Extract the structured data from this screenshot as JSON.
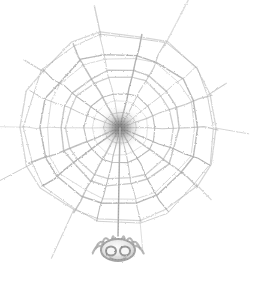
{
  "image": {
    "title": "Spider web with hanging spider",
    "subject": "orb-weaver spider web",
    "style": "faded grayscale halftone scan / clip-art illustration",
    "background_color": "#ffffff",
    "stroke_color": "#8a8a8a",
    "hub_color": "#4a4a4a",
    "spider_color": "#8d8d8d",
    "width": 259,
    "height": 291
  },
  "web": {
    "name": "orb-web",
    "center_x": 120,
    "center_y": 128,
    "radial_count": 18,
    "ring_count": 9,
    "outer_radius_x": 98,
    "outer_radius_y": 96,
    "inner_hub_radius": 11,
    "hub_blur_radius": 20,
    "anchor_strand_count": 10,
    "radial_angles_deg": [
      0,
      20,
      40,
      60,
      80,
      100,
      120,
      140,
      160,
      180,
      200,
      220,
      240,
      260,
      280,
      300,
      320,
      340
    ],
    "ring_radii": [
      16,
      26,
      37,
      48,
      59,
      69,
      79,
      88,
      96
    ],
    "ring_radius_jitter": [
      0.96,
      1.04,
      0.93,
      1.06,
      0.97,
      1.03,
      0.95,
      1.05,
      0.98
    ],
    "radial_jitter_deg": [
      0,
      2,
      -3,
      1.5,
      -2,
      3,
      -1,
      2.5,
      -2.5,
      0.5,
      2,
      -3,
      1,
      -1.5,
      2.5,
      -2,
      1.5,
      -1
    ]
  },
  "dropline": {
    "name": "drop-line",
    "from_x": 120,
    "from_y": 128,
    "to_x": 118,
    "to_y": 236
  },
  "spider": {
    "name": "spider",
    "center_x": 118,
    "center_y": 250,
    "body_width": 34,
    "body_height": 22,
    "leg_count": 8,
    "eye_count": 2,
    "eye_offset_x": 7,
    "eye_offset_y": 1,
    "eye_radius": 5
  },
  "caption": ""
}
